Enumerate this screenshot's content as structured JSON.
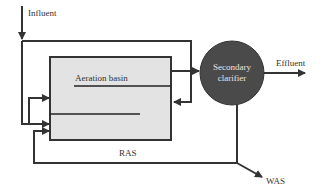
{
  "diagram": {
    "labels": {
      "influent": "Influent",
      "aeration_basin": "Aeration basin",
      "clarifier_line1": "Secondary",
      "clarifier_line2": "clarifier",
      "effluent": "Effluent",
      "ras": "RAS",
      "was": "WAS"
    },
    "colors": {
      "line": "#333333",
      "basin_fill": "#e3e3e3",
      "clarifier_fill": "#4a4a4a",
      "background": "#ffffff"
    },
    "nodes": [
      {
        "id": "aeration_basin",
        "shape": "rectangle"
      },
      {
        "id": "secondary_clarifier",
        "shape": "circle"
      }
    ],
    "edges": [
      {
        "from": "influent",
        "to": "aeration_basin",
        "label": "Influent"
      },
      {
        "from": "aeration_basin",
        "to": "secondary_clarifier"
      },
      {
        "from": "secondary_clarifier",
        "to": "effluent",
        "label": "Effluent"
      },
      {
        "from": "secondary_clarifier",
        "to": "aeration_basin",
        "label": "RAS"
      },
      {
        "from": "secondary_clarifier",
        "to": "was",
        "label": "WAS"
      }
    ]
  }
}
